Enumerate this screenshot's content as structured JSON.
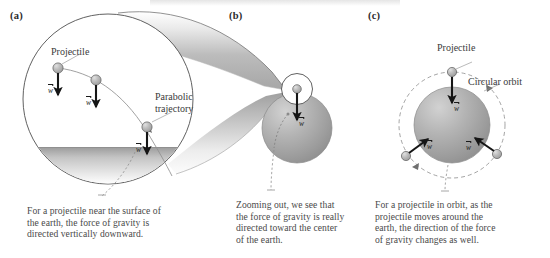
{
  "figure": {
    "width": 550,
    "height": 258,
    "background": "#ffffff"
  },
  "panels": [
    {
      "id": "a",
      "label": "(a)",
      "caption": [
        "For a projectile near the surface of",
        "the earth, the force of gravity is",
        "directed vertically downward."
      ],
      "annotations": [
        {
          "name": "projectile",
          "text": "Projectile"
        },
        {
          "name": "parabolic-trajectory-line1",
          "text": "Parabolic"
        },
        {
          "name": "parabolic-trajectory-line2",
          "text": "trajectory"
        }
      ],
      "vectors": [
        {
          "name": "weight-vector-1",
          "symbol": "w",
          "direction": "down"
        },
        {
          "name": "weight-vector-2",
          "symbol": "w",
          "direction": "down"
        },
        {
          "name": "weight-vector-3",
          "symbol": "w",
          "direction": "down"
        }
      ]
    },
    {
      "id": "b",
      "label": "(b)",
      "caption": [
        "Zooming out, we see that",
        "the force of gravity is really",
        "directed toward the center",
        "of the earth."
      ],
      "annotations": [],
      "vectors": [
        {
          "name": "weight-vector-1",
          "symbol": "w",
          "direction": "down"
        }
      ]
    },
    {
      "id": "c",
      "label": "(c)",
      "caption": [
        "For a projectile in orbit, as the",
        "projectile moves around the",
        "earth, the direction of the force",
        "of gravity changes as well."
      ],
      "annotations": [
        {
          "name": "projectile",
          "text": "Projectile"
        },
        {
          "name": "circular-orbit",
          "text": "Circular orbit"
        }
      ],
      "vectors": [
        {
          "name": "weight-vector-top",
          "symbol": "w",
          "direction": "down"
        },
        {
          "name": "weight-vector-left",
          "symbol": "w",
          "direction": "up-right"
        },
        {
          "name": "weight-vector-right",
          "symbol": "w",
          "direction": "up-left"
        }
      ]
    }
  ],
  "colors": {
    "earth_fill": "#a8a8a8",
    "earth_highlight": "#c9c9c9",
    "earth_edge": "#7e7e7e",
    "cone_fill": "#bdbdbd",
    "cone_highlight": "#e8e8e8",
    "ball_fill": "#b4b4b4",
    "ball_highlight": "#dcdcdc",
    "outline": "#555555",
    "arrow": "#151515",
    "ground": "#b0b0b0",
    "text": "#3a3a3a"
  }
}
